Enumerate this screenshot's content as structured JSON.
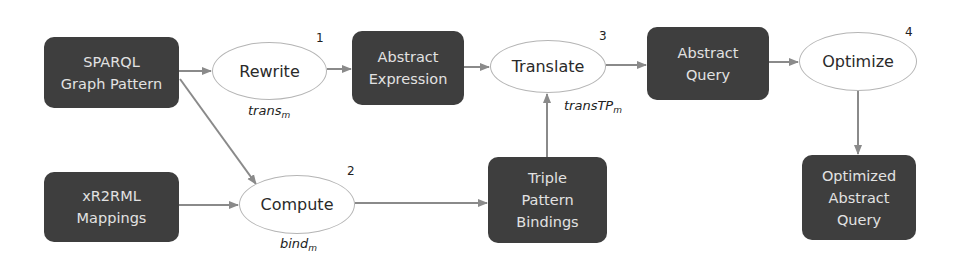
{
  "diagram": {
    "nodes": {
      "sparql": {
        "line1": "SPARQL",
        "line2": "Graph Pattern",
        "shape": "rounded-rect"
      },
      "xr2rml": {
        "line1": "xR2RML",
        "line2": "Mappings",
        "shape": "rounded-rect"
      },
      "rewrite": {
        "label": "Rewrite",
        "step": "1",
        "function": "trans",
        "function_sub": "m",
        "shape": "ellipse"
      },
      "compute": {
        "label": "Compute",
        "step": "2",
        "function": "bind",
        "function_sub": "m",
        "shape": "ellipse"
      },
      "abstract_expression": {
        "line1": "Abstract",
        "line2": "Expression",
        "shape": "rounded-rect"
      },
      "triple_pattern_bindings": {
        "line1": "Triple",
        "line2": "Pattern",
        "line3": "Bindings",
        "shape": "rounded-rect"
      },
      "translate": {
        "label": "Translate",
        "step": "3",
        "function": "transTP",
        "function_sub": "m",
        "shape": "ellipse"
      },
      "abstract_query": {
        "line1": "Abstract",
        "line2": "Query",
        "shape": "rounded-rect"
      },
      "optimize": {
        "label": "Optimize",
        "step": "4",
        "shape": "ellipse"
      },
      "optimized_abstract_query": {
        "line1": "Optimized",
        "line2": "Abstract",
        "line3": "Query",
        "shape": "rounded-rect"
      }
    },
    "edges": [
      {
        "from": "sparql",
        "to": "rewrite"
      },
      {
        "from": "sparql",
        "to": "compute"
      },
      {
        "from": "xr2rml",
        "to": "compute"
      },
      {
        "from": "rewrite",
        "to": "abstract_expression"
      },
      {
        "from": "abstract_expression",
        "to": "translate"
      },
      {
        "from": "compute",
        "to": "triple_pattern_bindings"
      },
      {
        "from": "triple_pattern_bindings",
        "to": "translate"
      },
      {
        "from": "translate",
        "to": "abstract_query"
      },
      {
        "from": "abstract_query",
        "to": "optimize"
      },
      {
        "from": "optimize",
        "to": "optimized_abstract_query"
      }
    ],
    "colors": {
      "box_fill": "#3e3e3e",
      "box_text": "#e2e2e2",
      "ellipse_border": "#b5b5b5",
      "arrow": "#8a8a8a"
    }
  }
}
